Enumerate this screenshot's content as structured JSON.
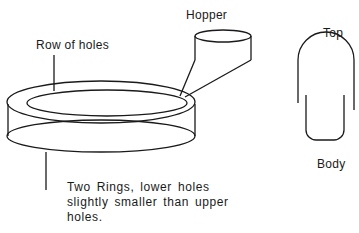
{
  "labels": {
    "hopper": "Hopper",
    "row_of_holes": "Row of holes",
    "top": "Top",
    "body": "Body"
  },
  "note": {
    "line1": "Two Rings, lower holes",
    "line2": "slightly smaller than upper",
    "line3": "holes."
  }
}
